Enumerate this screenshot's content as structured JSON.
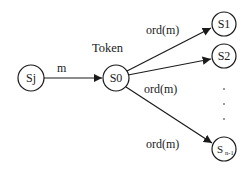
{
  "diagram": {
    "type": "token-distribution-graph",
    "token_label": "Token",
    "nodes": [
      {
        "id": "sj",
        "label": "Sj",
        "cx": 31,
        "cy": 78,
        "r": 13
      },
      {
        "id": "s0",
        "label": "S0",
        "cx": 116,
        "cy": 78,
        "r": 13
      },
      {
        "id": "s1",
        "label": "S1",
        "cx": 224,
        "cy": 24,
        "r": 12
      },
      {
        "id": "s2",
        "label": "S2",
        "cx": 224,
        "cy": 56,
        "r": 12
      },
      {
        "id": "sn1",
        "label": "S",
        "subscript": "n-1",
        "cx": 224,
        "cy": 149,
        "r": 12
      }
    ],
    "edges": [
      {
        "from": "sj",
        "to": "s0",
        "label": "m"
      },
      {
        "from": "s0",
        "to": "s1",
        "label": "ord(m)"
      },
      {
        "from": "s0",
        "to": "s2",
        "label": "ord(m)"
      },
      {
        "from": "s0",
        "to": "sn1",
        "label": "ord(m)"
      }
    ],
    "ellipsis": "⋮"
  }
}
